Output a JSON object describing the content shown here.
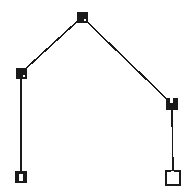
{
  "figure": {
    "width": 196,
    "height": 195,
    "background_color": "#ffffff",
    "stroke_color": "#1a1a1a"
  },
  "chart_data": {
    "type": "scatter",
    "xlabel": "",
    "ylabel": "",
    "xlim": [
      0,
      196
    ],
    "ylim": [
      0,
      195
    ],
    "grid": false,
    "legend": "none",
    "nodes": [
      {
        "id": "apex",
        "label": "apex",
        "x": 82,
        "y": 17,
        "marker": "square-filled",
        "size": 10,
        "color": "#1a1a1a",
        "inner_mark": "dot"
      },
      {
        "id": "left-shoulder",
        "label": "left shoulder",
        "x": 21,
        "y": 73,
        "marker": "square-filled",
        "size": 10,
        "color": "#1a1a1a",
        "inner_mark": "dot"
      },
      {
        "id": "right-shoulder",
        "label": "right shoulder",
        "x": 172,
        "y": 104,
        "marker": "square-filled",
        "size": 11,
        "color": "#1a1a1a",
        "inner_mark": "slot"
      },
      {
        "id": "left-foot",
        "label": "left foot",
        "x": 21,
        "y": 177,
        "marker": "square-filled",
        "size": 11,
        "color": "#1a1a1a",
        "inner_mark": "slot"
      },
      {
        "id": "right-foot",
        "label": "right foot",
        "x": 173,
        "y": 178,
        "marker": "square-hollow",
        "size": 14,
        "color": "#1a1a1a",
        "inner_mark": "slot"
      }
    ],
    "edges": [
      {
        "id": "edge-left-roof",
        "from": "left-shoulder",
        "to": "apex",
        "style": "solid",
        "width": 1.6
      },
      {
        "id": "edge-right-roof",
        "from": "apex",
        "to": "right-shoulder",
        "style": "solid",
        "width": 1.6
      },
      {
        "id": "edge-left-wall",
        "from": "left-shoulder",
        "to": "left-foot",
        "style": "solid",
        "width": 1.6
      },
      {
        "id": "edge-right-wall",
        "from": "right-shoulder",
        "to": "right-foot",
        "style": "solid",
        "width": 1.6
      }
    ]
  },
  "accessibility": {
    "description": "A white canvas showing five square node markers joined by four thin black lines forming a house or arch outline: two diagonal roof segments meeting at a top apex, and two vertical wall segments descending to the base."
  }
}
